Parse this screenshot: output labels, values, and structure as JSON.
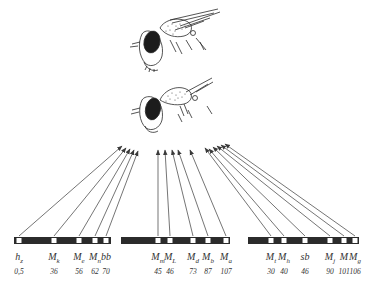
{
  "figure": {
    "flies": [
      {
        "id": "fly-top",
        "label": "normal"
      },
      {
        "id": "fly-bottom",
        "label": "mutant"
      }
    ],
    "ink_color": "#2a2a2a",
    "background": "#ffffff"
  },
  "chromosomes": [
    {
      "id": "chromosome-1",
      "bar": {
        "x1": 14,
        "x2": 111
      },
      "loci": [
        {
          "symbol": "h",
          "sub": "z",
          "position": "0,5",
          "x": 19
        },
        {
          "symbol": "M",
          "sub": "k",
          "position": "36",
          "x": 54
        },
        {
          "symbol": "M",
          "sub": "e",
          "position": "56",
          "x": 79
        },
        {
          "symbol": "M",
          "sub": "n",
          "position": "62",
          "x": 95
        },
        {
          "symbol": "bb",
          "sub": "",
          "position": "70",
          "x": 106
        }
      ]
    },
    {
      "id": "chromosome-2",
      "bar": {
        "x1": 121,
        "x2": 230
      },
      "loci": [
        {
          "symbol": "M",
          "sub": "m",
          "position": "45",
          "x": 158
        },
        {
          "symbol": "M",
          "sub": "L",
          "position": "46",
          "x": 170
        },
        {
          "symbol": "M",
          "sub": "d",
          "position": "73",
          "x": 193
        },
        {
          "symbol": "M",
          "sub": "b",
          "position": "87",
          "x": 208
        },
        {
          "symbol": "M",
          "sub": "a",
          "position": "107",
          "x": 226
        }
      ]
    },
    {
      "id": "chromosome-3",
      "bar": {
        "x1": 248,
        "x2": 359
      },
      "loci": [
        {
          "symbol": "M",
          "sub": "t",
          "position": "30",
          "x": 271
        },
        {
          "symbol": "M",
          "sub": "h",
          "position": "40",
          "x": 284
        },
        {
          "symbol": "sb",
          "sub": "",
          "position": "46",
          "x": 305
        },
        {
          "symbol": "M",
          "sub": "j",
          "position": "90",
          "x": 330
        },
        {
          "symbol": "M",
          "sub": "",
          "position": "101",
          "x": 344
        },
        {
          "symbol": "M",
          "sub": "g",
          "position": "106",
          "x": 355
        }
      ]
    }
  ],
  "arrows": {
    "target_region": {
      "x1": 125,
      "x2": 225,
      "y": 146
    },
    "count": 16
  }
}
